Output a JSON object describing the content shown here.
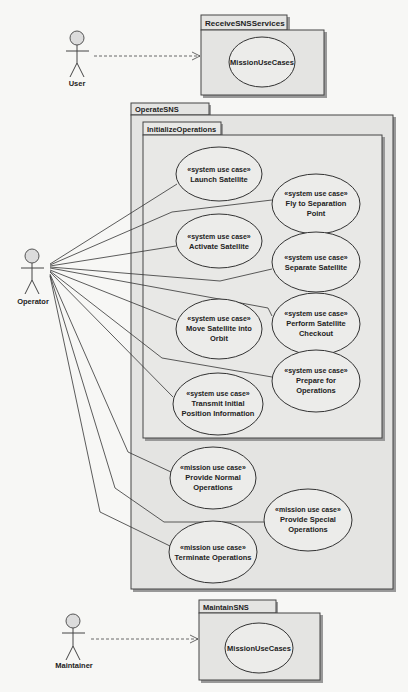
{
  "actors": [
    {
      "id": "user",
      "label": "User"
    },
    {
      "id": "operator",
      "label": "Operator"
    },
    {
      "id": "maintainer",
      "label": "Maintainer"
    }
  ],
  "packages": {
    "receive": {
      "name": "ReceiveSNSServices",
      "content": "MissionUseCases"
    },
    "operate": {
      "name": "OperateSNS"
    },
    "initialize": {
      "name": "InitializeOperations"
    },
    "maintain": {
      "name": "MaintainSNS",
      "content": "MissionUseCases"
    }
  },
  "use_cases": {
    "launch": {
      "stereotype": "«system use case»",
      "line1": "Launch Satellite",
      "line2": ""
    },
    "fly": {
      "stereotype": "«system use case»",
      "line1": "Fly to Separation",
      "line2": "Point"
    },
    "activate": {
      "stereotype": "«system use case»",
      "line1": "Activate Satellite",
      "line2": ""
    },
    "separate": {
      "stereotype": "«system use case»",
      "line1": "Separate Satellite",
      "line2": ""
    },
    "checkout": {
      "stereotype": "«system use case»",
      "line1": "Perform Satellite",
      "line2": "Checkout"
    },
    "orbit": {
      "stereotype": "«system use case»",
      "line1": "Move Satellite into",
      "line2": "Orbit"
    },
    "prepare": {
      "stereotype": "«system use case»",
      "line1": "Prepare for",
      "line2": "Operations"
    },
    "transmit": {
      "stereotype": "«system use case»",
      "line1": "Transmit Initial",
      "line2": "Position Information"
    },
    "normal": {
      "stereotype": "«mission use case»",
      "line1": "Provide Normal",
      "line2": "Operations"
    },
    "special": {
      "stereotype": "«mission use case»",
      "line1": "Provide Special",
      "line2": "Operations"
    },
    "terminate": {
      "stereotype": "«mission use case»",
      "line1": "Terminate Operations",
      "line2": ""
    }
  },
  "colors": {
    "background": "#f7f7f5",
    "package_fill": "#e4e4e2",
    "use_case_fill": "#ececea",
    "stroke": "#333333"
  }
}
